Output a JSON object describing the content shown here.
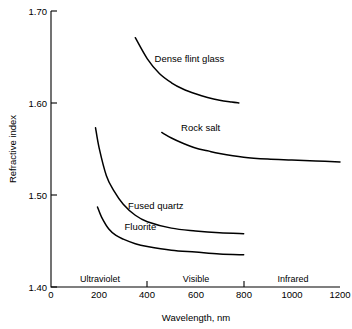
{
  "chart_data": {
    "type": "line",
    "title": "",
    "xlabel": "Wavelength, nm",
    "ylabel": "Refractive index",
    "xlim": [
      0,
      1200
    ],
    "ylim": [
      1.4,
      1.7
    ],
    "xticks": [
      "0",
      "200",
      "400",
      "600",
      "800",
      "1000",
      "1200"
    ],
    "xtick_values": [
      0,
      200,
      400,
      600,
      800,
      1000,
      1200
    ],
    "yticks": [
      "1.40",
      "1.50",
      "1.60",
      "1.70"
    ],
    "ytick_values": [
      1.4,
      1.5,
      1.6,
      1.7
    ],
    "grid": false,
    "legend": "inline-labels",
    "regions": [
      {
        "name": "Ultraviolet",
        "label": "Ultraviolet",
        "start": 0,
        "end": 400,
        "center": 200
      },
      {
        "name": "Visible",
        "label": "Visible",
        "start": 400,
        "end": 800,
        "center": 600
      },
      {
        "name": "Infrared",
        "label": "Infrared",
        "start": 800,
        "end": 1200,
        "center": 1000
      }
    ],
    "region_boundary_ticks": [
      400,
      800
    ],
    "series": [
      {
        "name": "Dense flint glass",
        "label": "Dense flint glass",
        "x": [
          350,
          400,
          450,
          500,
          550,
          600,
          650,
          700,
          750,
          780
        ],
        "y": [
          1.671,
          1.648,
          1.632,
          1.622,
          1.615,
          1.61,
          1.606,
          1.603,
          1.601,
          1.6
        ]
      },
      {
        "name": "Rock salt",
        "label": "Rock salt",
        "x": [
          460,
          500,
          550,
          600,
          650,
          700,
          800,
          900,
          1000,
          1100,
          1200
        ],
        "y": [
          1.568,
          1.562,
          1.556,
          1.551,
          1.548,
          1.545,
          1.541,
          1.539,
          1.538,
          1.537,
          1.536
        ]
      },
      {
        "name": "Fused quartz",
        "label": "Fused quartz",
        "x": [
          185,
          200,
          230,
          260,
          300,
          350,
          400,
          500,
          600,
          700,
          800
        ],
        "y": [
          1.573,
          1.551,
          1.521,
          1.505,
          1.49,
          1.478,
          1.471,
          1.464,
          1.461,
          1.459,
          1.458
        ]
      },
      {
        "name": "Fluorite",
        "label": "Fluorite",
        "x": [
          193,
          210,
          240,
          270,
          300,
          350,
          400,
          500,
          600,
          700,
          800
        ],
        "y": [
          1.487,
          1.476,
          1.463,
          1.456,
          1.452,
          1.447,
          1.444,
          1.44,
          1.438,
          1.436,
          1.435
        ]
      }
    ],
    "series_label_positions": [
      {
        "name": "Dense flint glass",
        "x": 430,
        "y": 1.645
      },
      {
        "name": "Rock salt",
        "x": 540,
        "y": 1.57
      },
      {
        "name": "Fused quartz",
        "x": 320,
        "y": 1.485
      },
      {
        "name": "Fluorite",
        "x": 305,
        "y": 1.462
      }
    ]
  }
}
